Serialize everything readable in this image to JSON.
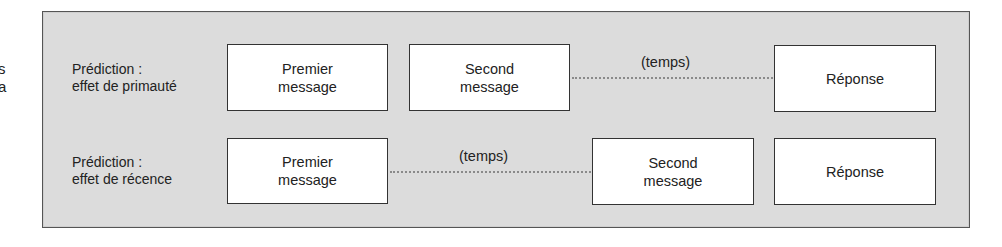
{
  "edge_fragments": [
    "s",
    "a"
  ],
  "rows": [
    {
      "label_line1": "Prédiction :",
      "label_line2": "effet de primauté",
      "box1_line1": "Premier",
      "box1_line2": "message",
      "box2_line1": "Second",
      "box2_line2": "message",
      "gap_label": "(temps)",
      "box3": "Réponse"
    },
    {
      "label_line1": "Prédiction :",
      "label_line2": "effet de récence",
      "box1_line1": "Premier",
      "box1_line2": "message",
      "gap_label": "(temps)",
      "box2_line1": "Second",
      "box2_line2": "message",
      "box3": "Réponse"
    }
  ],
  "colors": {
    "panel_bg": "#dcdcdc",
    "panel_border": "#555555",
    "box_bg": "#ffffff",
    "dotted_line": "#8a8a8a"
  }
}
